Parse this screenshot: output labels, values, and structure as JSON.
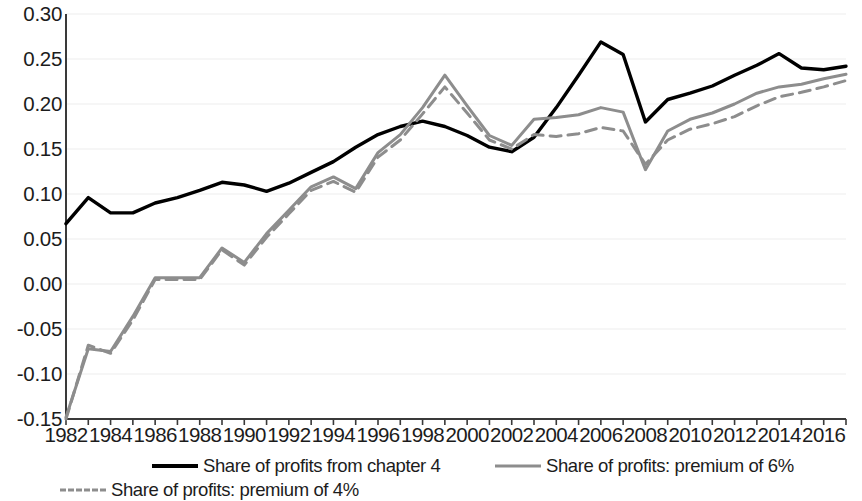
{
  "chart_data": {
    "type": "line",
    "title": "",
    "subtitle": "",
    "xlabel": "",
    "ylabel": "",
    "xlim": [
      1982,
      2017
    ],
    "ylim": [
      -0.15,
      0.3
    ],
    "grid": true,
    "legend_position": "bottom",
    "x": [
      1982,
      1983,
      1984,
      1985,
      1986,
      1987,
      1988,
      1989,
      1990,
      1991,
      1992,
      1993,
      1994,
      1995,
      1996,
      1997,
      1998,
      1999,
      2000,
      2001,
      2002,
      2003,
      2004,
      2005,
      2006,
      2007,
      2008,
      2009,
      2010,
      2011,
      2012,
      2013,
      2014,
      2015,
      2016,
      2017
    ],
    "xticks": [
      1982,
      1984,
      1986,
      1988,
      1990,
      1992,
      1994,
      1996,
      1998,
      2000,
      2002,
      2004,
      2006,
      2008,
      2010,
      2012,
      2014,
      2016
    ],
    "xtick_labels": [
      "1982",
      "1984",
      "1986",
      "1988",
      "1990",
      "1992",
      "1994",
      "1996",
      "1998",
      "2000",
      "2002",
      "2004",
      "2006",
      "2008",
      "2010",
      "2012",
      "2014",
      "2016"
    ],
    "yticks": [
      -0.15,
      -0.1,
      -0.05,
      0.0,
      0.05,
      0.1,
      0.15,
      0.2,
      0.25,
      0.3
    ],
    "ytick_labels": [
      "-0.15",
      "-0.10",
      "-0.05",
      "0.00",
      "0.05",
      "0.10",
      "0.15",
      "0.20",
      "0.25",
      "0.30"
    ],
    "series": [
      {
        "name": "Share of profits from chapter 4",
        "color": "#000000",
        "style": "solid",
        "width": 3.4,
        "values": [
          0.067,
          0.096,
          0.079,
          0.079,
          0.09,
          0.096,
          0.104,
          0.113,
          0.11,
          0.103,
          0.112,
          0.124,
          0.136,
          0.152,
          0.166,
          0.175,
          0.181,
          0.175,
          0.165,
          0.152,
          0.147,
          0.163,
          0.196,
          0.232,
          0.269,
          0.255,
          0.18,
          0.205,
          0.212,
          0.22,
          0.232,
          0.243,
          0.256,
          0.24,
          0.238,
          0.242
        ]
      },
      {
        "name": "Share of profits: premium of 6%",
        "color": "#8d8d8d",
        "style": "solid",
        "width": 3.0,
        "values": [
          -0.148,
          -0.072,
          -0.075,
          -0.036,
          0.007,
          0.007,
          0.007,
          0.04,
          0.024,
          0.056,
          0.082,
          0.108,
          0.119,
          0.106,
          0.146,
          0.166,
          0.196,
          0.232,
          0.198,
          0.165,
          0.154,
          0.183,
          0.185,
          0.188,
          0.196,
          0.191,
          0.127,
          0.17,
          0.183,
          0.19,
          0.2,
          0.212,
          0.219,
          0.222,
          0.228,
          0.233
        ]
      },
      {
        "name": "Share of profits: premium of 4%",
        "color": "#8d8d8d",
        "style": "dashed",
        "width": 3.0,
        "values": [
          -0.15,
          -0.068,
          -0.077,
          -0.04,
          0.005,
          0.005,
          0.005,
          0.038,
          0.021,
          0.052,
          0.078,
          0.104,
          0.114,
          0.102,
          0.141,
          0.16,
          0.189,
          0.219,
          0.19,
          0.16,
          0.15,
          0.166,
          0.164,
          0.167,
          0.174,
          0.17,
          0.133,
          0.16,
          0.172,
          0.178,
          0.186,
          0.198,
          0.208,
          0.213,
          0.219,
          0.226
        ]
      }
    ]
  },
  "legend": {
    "items": [
      {
        "label": "Share of profits from chapter 4",
        "swatch": "solid-black-line-icon"
      },
      {
        "label": "Share of profits: premium of 6%",
        "swatch": "solid-grey-line-icon"
      },
      {
        "label": "Share of profits: premium of 4%",
        "swatch": "dashed-grey-line-icon"
      }
    ]
  },
  "colors": {
    "series_primary": "#000000",
    "series_secondary": "#8d8d8d",
    "axis": "#3a3a3a",
    "gridline": "#ededed",
    "background": "#ffffff",
    "text": "#1c1c1c"
  }
}
